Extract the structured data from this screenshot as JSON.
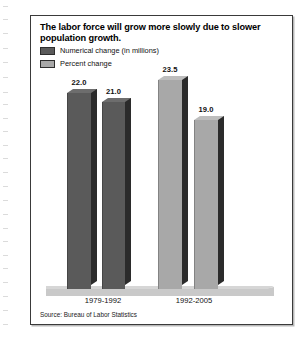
{
  "figure": {
    "title": "The labor force will grow more slowly due to slower population growth.",
    "source": "Source: Bureau of Labor Statistics"
  },
  "legend": {
    "items": [
      {
        "label": "Numerical change (in millions)",
        "swatch_name": "legend-swatch-numerical-change",
        "color": "#5a5a5a"
      },
      {
        "label": "Percent change",
        "swatch_name": "legend-swatch-percent-change",
        "color": "#a8a8a8"
      }
    ]
  },
  "colors": {
    "series_numerical_change": "#5a5a5a",
    "series_percent_change": "#a8a8a8",
    "bar_side_shadow": "#2b2b2b",
    "bar_top_dark": "#6d6d6d",
    "bar_top_light": "#bdbdbd",
    "floor": "#c9c9c9",
    "frame_border": "#3a3a3a",
    "text": "#111111"
  },
  "bars": [
    {
      "id": "bar-1979-1992-numerical",
      "value": "22.0",
      "group": "1979-1992",
      "series": "Numerical change (in millions)",
      "fill": "#5a5a5a",
      "top": "#6d6d6d",
      "left": 27,
      "width": 24,
      "height": 196
    },
    {
      "id": "bar-1979-1992-percent",
      "value": "21.0",
      "group": "1979-1992",
      "series": "Percent change",
      "fill": "#5a5a5a",
      "top": "#6d6d6d",
      "left": 62,
      "width": 23,
      "height": 187
    },
    {
      "id": "bar-1992-2005-numerical",
      "value": "23.5",
      "group": "1992-2005",
      "series": "Numerical change (in millions)",
      "fill": "#a8a8a8",
      "top": "#bdbdbd",
      "left": 118,
      "width": 24,
      "height": 209
    },
    {
      "id": "bar-1992-2005-percent",
      "value": "19.0",
      "group": "1992-2005",
      "series": "Percent change",
      "fill": "#a8a8a8",
      "top": "#bdbdbd",
      "left": 154,
      "width": 24,
      "height": 169
    }
  ],
  "categories": [
    {
      "label": "1979-1992",
      "center": 63
    },
    {
      "label": "1992-2005",
      "center": 154
    }
  ],
  "chart_data": {
    "type": "bar",
    "title": "The labor force will grow more slowly due to slower population growth.",
    "subtitle": "",
    "xlabel": "",
    "ylabel": "",
    "categories": [
      "1979-1992",
      "1992-2005"
    ],
    "series": [
      {
        "name": "Numerical change (in millions)",
        "values": [
          22.0,
          23.5
        ],
        "color": "#5a5a5a"
      },
      {
        "name": "Percent change",
        "values": [
          21.0,
          19.0
        ],
        "color": "#a8a8a8"
      }
    ],
    "data_labels": [
      "22.0",
      "21.0",
      "23.5",
      "19.0"
    ],
    "ylim": [
      0,
      25
    ],
    "grid": false,
    "axis_ticks": false,
    "legend_position": "top-left",
    "style": "3d-columns",
    "source": "Source: Bureau of Labor Statistics"
  }
}
